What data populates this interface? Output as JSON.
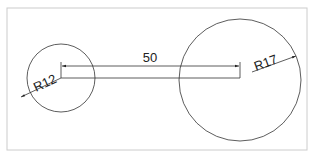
{
  "diagram": {
    "type": "engineering-drawing",
    "frame": {
      "x": 7,
      "y": 8,
      "width": 300,
      "height": 142,
      "color": "#cccccc"
    },
    "line_color": "#333333",
    "circles": [
      {
        "name": "small-circle",
        "cx": 61,
        "cy": 78,
        "r": 34,
        "label": "R12"
      },
      {
        "name": "large-circle",
        "cx": 240,
        "cy": 80,
        "r": 61,
        "label": "R17"
      }
    ],
    "linear_dimension": {
      "label": "50",
      "from_x": 61,
      "to_x": 240,
      "y": 66
    }
  }
}
